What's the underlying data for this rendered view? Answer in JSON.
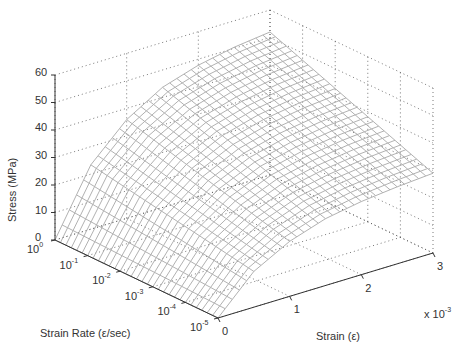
{
  "chart_data": {
    "type": "surface",
    "title": "",
    "xlabel": "Strain (ε)",
    "ylabel": "Strain Rate (ε/sec)",
    "zlabel": "Stress (MPa)",
    "x_multiplier": "x 10",
    "x_multiplier_exp": "-3",
    "x_ticks": [
      "0",
      "1",
      "2",
      "3"
    ],
    "x_range": [
      0,
      3
    ],
    "y_ticks": [
      {
        "base": "10",
        "exp": "0"
      },
      {
        "base": "10",
        "exp": "-1"
      },
      {
        "base": "10",
        "exp": "-2"
      },
      {
        "base": "10",
        "exp": "-3"
      },
      {
        "base": "10",
        "exp": "-4"
      },
      {
        "base": "10",
        "exp": "-5"
      }
    ],
    "y_log10_range": [
      0,
      -5
    ],
    "z_ticks": [
      "0",
      "10",
      "20",
      "30",
      "40",
      "50",
      "60"
    ],
    "zlim": [
      0,
      60
    ],
    "grid": true,
    "strain_samples_e3": [
      0,
      0.5,
      1.0,
      1.5,
      2.0,
      2.5,
      3.0
    ],
    "rate_log10_samples": [
      0,
      -1,
      -2,
      -3,
      -4,
      -5
    ],
    "stress_MPa": [
      [
        0,
        23.4,
        35.9,
        43.7,
        47.8,
        50.4,
        52.0
      ],
      [
        0,
        21.3,
        32.7,
        39.8,
        43.6,
        46.0,
        47.4
      ],
      [
        0,
        19.2,
        29.5,
        35.9,
        39.4,
        41.5,
        42.8
      ],
      [
        0,
        17.2,
        26.3,
        32.0,
        35.1,
        37.0,
        38.2
      ],
      [
        0,
        15.1,
        23.1,
        28.2,
        30.8,
        32.5,
        33.6
      ],
      [
        0,
        13.0,
        20.0,
        24.3,
        26.6,
        28.0,
        29.0
      ]
    ],
    "colors": {
      "mesh": "#a8a8a8",
      "grid": "#555555",
      "axis": "#333333",
      "text": "#333333"
    }
  }
}
